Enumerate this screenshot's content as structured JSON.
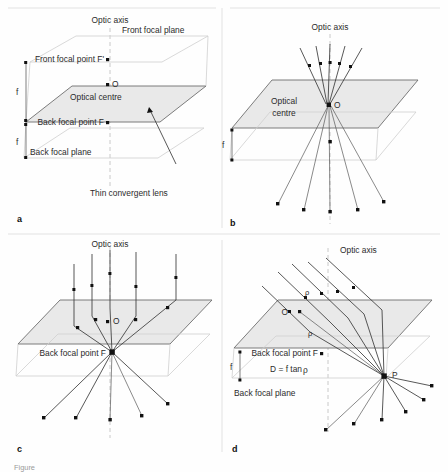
{
  "figure": {
    "width": 448,
    "height": 472,
    "background": "#fefefe",
    "plane_fill": "#e8e8e8",
    "plane_stroke": "#6a6a6a",
    "guide_stroke": "#c9c9c9",
    "ray_stroke": "#3a3a3a",
    "axis_stroke": "#b9b9b9",
    "text_color": "#2b2b2b",
    "caption": "Figure"
  },
  "panels": [
    {
      "id": "a",
      "letter": "a",
      "title": "Thin convergent lens geometry",
      "labels": {
        "optic_axis": "Optic axis",
        "front_focal_plane": "Front focal plane",
        "front_focal_point": "Front focal point F'",
        "optical_centre": "Optical centre",
        "centre_point": "O",
        "back_focal_point": "Back focal point F",
        "back_focal_plane": "Back focal plane",
        "lens_callout": "Thin convergent lens",
        "focal_length_upper": "f",
        "focal_length_lower": "f"
      }
    },
    {
      "id": "b",
      "letter": "b",
      "title": "Rays through the optical centre",
      "labels": {
        "optic_axis": "Optic axis",
        "optical_centre_line1": "Optical",
        "optical_centre_line2": "centre",
        "centre_point": "O",
        "focal_length": "f"
      }
    },
    {
      "id": "c",
      "letter": "c",
      "title": "Axial parallel rays focus at F",
      "labels": {
        "optic_axis": "Optic axis",
        "centre_point": "O",
        "back_focal_point": "Back focal point F"
      }
    },
    {
      "id": "d",
      "letter": "d",
      "title": "Oblique parallel rays focus at P",
      "labels": {
        "optic_axis": "Optic axis",
        "centre_point": "O",
        "back_focal_point": "Back focal point F",
        "focus_point": "P",
        "formula": "D = f tan",
        "formula_symbol": "ρ",
        "angle_symbol_upper": "ρ",
        "angle_symbol_lower": "ρ",
        "back_focal_plane": "Back focal plane",
        "focal_length": "f"
      }
    }
  ]
}
